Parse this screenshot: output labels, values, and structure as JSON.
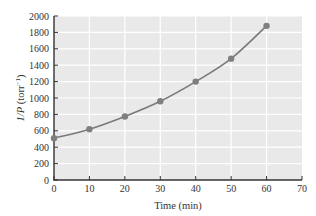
{
  "chart_data": {
    "type": "line",
    "title": "",
    "xlabel": "Time (min)",
    "ylabel": "1/P (torr⁻¹)",
    "ylabel_parts": {
      "italic": "1/P",
      "rest": " (torr",
      "sup": "−1",
      "close": ")"
    },
    "x": [
      0,
      10,
      20,
      30,
      40,
      50,
      60
    ],
    "series": [
      {
        "name": "1/P",
        "values": [
          510,
          620,
          775,
          960,
          1200,
          1480,
          1880
        ],
        "color": "#7a7a7a"
      }
    ],
    "xlim": [
      0,
      70
    ],
    "ylim": [
      0,
      2000
    ],
    "xticks": [
      0,
      10,
      20,
      30,
      40,
      50,
      60,
      70
    ],
    "yticks": [
      0,
      200,
      400,
      600,
      800,
      1000,
      1200,
      1400,
      1600,
      1800,
      2000
    ],
    "grid": true,
    "legend": null,
    "colors": {
      "plot_background": "#e9e9e9",
      "gridline": "#ffffff",
      "axis": "#333333",
      "marker": "#7f7f7f",
      "line": "#7a7a7a"
    }
  }
}
